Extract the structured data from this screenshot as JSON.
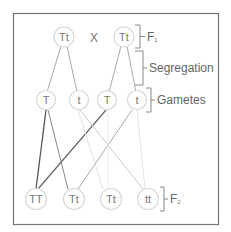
{
  "diagram": {
    "cross_symbol": "X",
    "parents": [
      {
        "label": "Tt"
      },
      {
        "label": "Tt"
      }
    ],
    "gametes": [
      {
        "label": "T"
      },
      {
        "label": "t"
      },
      {
        "label": "T"
      },
      {
        "label": "t"
      }
    ],
    "offspring": [
      {
        "label": "TT"
      },
      {
        "label": "Tt"
      },
      {
        "label": "Tt"
      },
      {
        "label": "tt"
      }
    ],
    "annotations": {
      "f1": "F",
      "f1_sub": "1",
      "segregation": "Segregation",
      "gametes": "Gametes",
      "f2": "F",
      "f2_sub": "2"
    }
  }
}
